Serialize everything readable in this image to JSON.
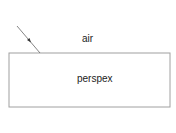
{
  "diagram": {
    "upper_medium_label": "air",
    "lower_medium_label": "perspex",
    "incident_ray": {
      "from": [
        17,
        26
      ],
      "to": [
        40,
        53
      ]
    },
    "block": {
      "x": 9,
      "y": 53,
      "width": 161,
      "height": 54
    },
    "colors": {
      "line": "#999999",
      "ray": "#555555",
      "text": "#222222"
    }
  }
}
